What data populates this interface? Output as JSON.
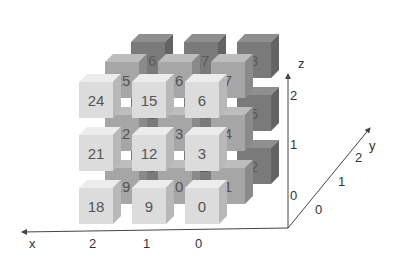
{
  "colors": {
    "front_face": "#dcdcdc",
    "front_top": "#ececec",
    "front_side": "#b8b8b8",
    "front_text": "#555555",
    "mid_face": "#a6a6a6",
    "mid_top": "#bdbdbd",
    "mid_side": "#8a8a8a",
    "mid_text": "#555555",
    "back_face": "#7a7a7a",
    "back_top": "#8f8f8f",
    "back_side": "#636363",
    "back_text": "#5a5a5a",
    "axis": "#444444"
  },
  "layers": [
    {
      "name": "y2",
      "dx": 52,
      "dy": -40,
      "style": "back",
      "cubes": [
        [
          26,
          17,
          8
        ],
        [
          23,
          14,
          5
        ],
        [
          20,
          11,
          2
        ]
      ]
    },
    {
      "name": "y1",
      "dx": 26,
      "dy": -20,
      "style": "mid",
      "cubes": [
        [
          25,
          16,
          7
        ],
        [
          22,
          13,
          4
        ],
        [
          19,
          10,
          1
        ]
      ]
    },
    {
      "name": "y0",
      "dx": 0,
      "dy": 0,
      "style": "front",
      "cubes": [
        [
          24,
          15,
          6
        ],
        [
          21,
          12,
          3
        ],
        [
          18,
          9,
          0
        ]
      ]
    }
  ],
  "grid": {
    "origin_x": 79,
    "origin_y": 74,
    "step_x": 53,
    "step_y": 53
  },
  "axes": {
    "x": {
      "label": "x",
      "ticks": [
        "2",
        "1",
        "0"
      ]
    },
    "y": {
      "label": "y",
      "ticks": [
        "0",
        "1",
        "2"
      ]
    },
    "z": {
      "label": "z",
      "ticks": [
        "0",
        "1",
        "2"
      ]
    }
  }
}
